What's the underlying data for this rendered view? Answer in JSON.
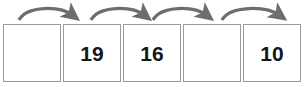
{
  "worksheet": {
    "type": "number-sequence-fill-in-the-blank",
    "title": "Number sequence with skip-count arrows",
    "colors": {
      "box_border": "#9a9a9a",
      "box_fill": "#ffffff",
      "arrow": "#6e6e6e",
      "text": "#161616",
      "background": "#ffffff"
    },
    "boxes": [
      {
        "id": "box-1",
        "value": "",
        "empty": true
      },
      {
        "id": "box-2",
        "value": "19",
        "empty": false
      },
      {
        "id": "box-3",
        "value": "16",
        "empty": false
      },
      {
        "id": "box-4",
        "value": "",
        "empty": true
      },
      {
        "id": "box-5",
        "value": "10",
        "empty": false
      }
    ],
    "arrows": [
      {
        "id": "arrow-1",
        "from": "box-1",
        "to": "box-2",
        "label": "",
        "direction": "left-to-right-curved"
      },
      {
        "id": "arrow-2",
        "from": "box-2",
        "to": "box-3",
        "label": "",
        "direction": "left-to-right-curved"
      },
      {
        "id": "arrow-3",
        "from": "box-3",
        "to": "box-4",
        "label": "",
        "direction": "left-to-right-curved"
      },
      {
        "id": "arrow-4",
        "from": "box-4",
        "to": "box-5",
        "label": "",
        "direction": "left-to-right-curved"
      }
    ]
  }
}
